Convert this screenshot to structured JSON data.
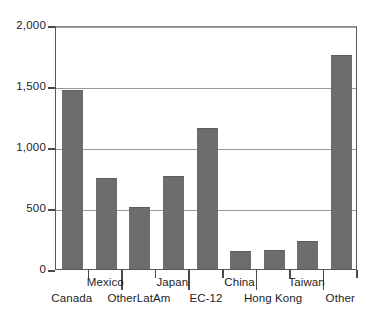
{
  "chart_data": {
    "type": "bar",
    "title": "",
    "subtitle": "",
    "xlabel": "",
    "ylabel": "",
    "categories": [
      "Canada",
      "Mexico",
      "OtherLatAm",
      "Japan",
      "EC-12",
      "China",
      "Hong Kong",
      "Taiwan",
      "Other"
    ],
    "values": [
      1460,
      735,
      500,
      755,
      1145,
      140,
      150,
      225,
      1745
    ],
    "series": [
      {
        "name": "",
        "values": [
          1460,
          735,
          500,
          755,
          1145,
          140,
          150,
          225,
          1745
        ]
      }
    ],
    "ylim": [
      0,
      2000
    ],
    "ytick_values": [
      0,
      500,
      1000,
      1500,
      2000
    ],
    "ytick_labels": [
      "0",
      "500",
      "1,000",
      "1,500",
      "2,000"
    ],
    "grid": true,
    "legend": false,
    "legend_position": "none",
    "bar_color": "#6d6d6f",
    "axis_color": "#4a4a4d",
    "grid_color": "#9a9a9d",
    "background_color": "#ffffff",
    "label_rows": [
      "bottom",
      "top",
      "bottom",
      "top",
      "bottom",
      "top",
      "bottom",
      "top",
      "bottom"
    ]
  }
}
